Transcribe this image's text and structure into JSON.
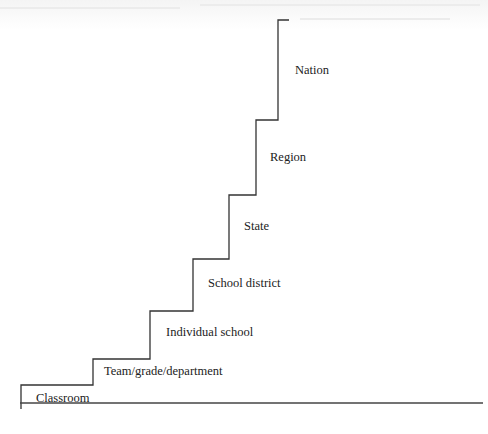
{
  "diagram": {
    "type": "staircase",
    "steps": [
      {
        "id": "classroom",
        "label": "Classroom"
      },
      {
        "id": "team",
        "label": "Team/grade/department"
      },
      {
        "id": "school",
        "label": "Individual school"
      },
      {
        "id": "district",
        "label": "School district"
      },
      {
        "id": "state",
        "label": "State"
      },
      {
        "id": "region",
        "label": "Region"
      },
      {
        "id": "nation",
        "label": "Nation"
      }
    ],
    "colors": {
      "line": "#333333",
      "text": "#222222",
      "background": "#ffffff"
    }
  }
}
